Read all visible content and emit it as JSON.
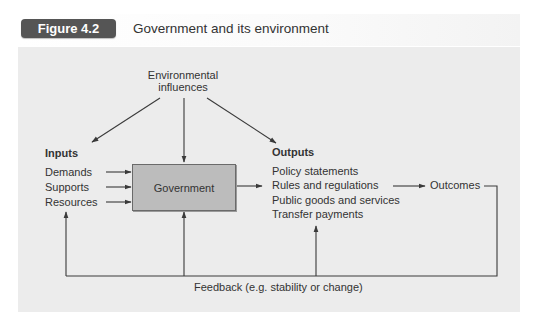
{
  "figure": {
    "badge_label": "Figure 4.2",
    "title": "Government and its environment",
    "badge_color": "#555555",
    "panel_color": "#ececec"
  },
  "diagram": {
    "environment": {
      "line1": "Environmental",
      "line2": "influences"
    },
    "inputs": {
      "heading": "Inputs",
      "items": [
        "Demands",
        "Supports",
        "Resources"
      ]
    },
    "central_node": {
      "label": "Government",
      "fill_color": "#bcbcbc"
    },
    "outputs": {
      "heading": "Outputs",
      "items": [
        "Policy statements",
        "Rules and regulations",
        "Public goods and services",
        "Transfer payments"
      ]
    },
    "outcomes": {
      "label": "Outcomes"
    },
    "feedback": {
      "label": "Feedback (e.g. stability or change)"
    },
    "edges": [
      {
        "from": "Environmental influences",
        "to": "Inputs"
      },
      {
        "from": "Environmental influences",
        "to": "Government"
      },
      {
        "from": "Environmental influences",
        "to": "Outputs"
      },
      {
        "from": "Demands",
        "to": "Government"
      },
      {
        "from": "Supports",
        "to": "Government"
      },
      {
        "from": "Resources",
        "to": "Government"
      },
      {
        "from": "Government",
        "to": "Outputs"
      },
      {
        "from": "Outputs",
        "to": "Outcomes"
      },
      {
        "from": "Outcomes",
        "to": "Feedback"
      },
      {
        "from": "Feedback",
        "to": "Inputs"
      },
      {
        "from": "Feedback",
        "to": "Government"
      },
      {
        "from": "Feedback",
        "to": "Outputs"
      }
    ]
  }
}
